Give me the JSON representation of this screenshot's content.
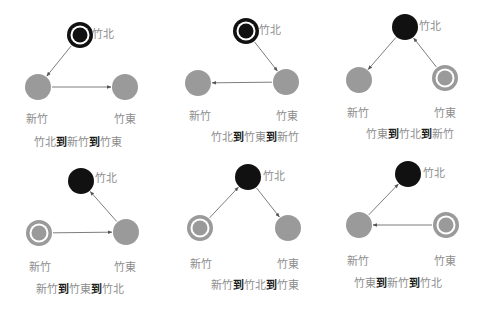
{
  "colors": {
    "node_fill": "#9a9a9a",
    "current_fill": "#111111",
    "edge": "#6e6e6e",
    "label": "#8c8c8c",
    "connector": "#1a1a1a"
  },
  "legend": {
    "current_node": "black filled circle",
    "start_node": "double ring circle",
    "other_node": "grey filled circle"
  },
  "connector": "到",
  "panels": [
    {
      "id": "p1",
      "caption": [
        "竹北",
        "新竹",
        "竹東"
      ],
      "start": "竹北",
      "current": "竹北",
      "nodes": {
        "竹北": "start-current",
        "新竹": "normal",
        "竹東": "normal"
      },
      "edges": [
        [
          "竹北",
          "新竹"
        ],
        [
          "新竹",
          "竹東"
        ]
      ]
    },
    {
      "id": "p2",
      "caption": [
        "竹北",
        "竹東",
        "新竹"
      ],
      "start": "竹北",
      "current": "竹北",
      "nodes": {
        "竹北": "start-current",
        "新竹": "normal",
        "竹東": "normal"
      },
      "edges": [
        [
          "竹北",
          "竹東"
        ],
        [
          "竹東",
          "新竹"
        ]
      ]
    },
    {
      "id": "p3",
      "caption": [
        "竹東",
        "竹北",
        "新竹"
      ],
      "start": "竹東",
      "current": "竹北",
      "nodes": {
        "竹北": "current",
        "新竹": "normal",
        "竹東": "start"
      },
      "edges": [
        [
          "竹東",
          "竹北"
        ],
        [
          "竹北",
          "新竹"
        ]
      ]
    },
    {
      "id": "p4",
      "caption": [
        "新竹",
        "竹東",
        "竹北"
      ],
      "start": "新竹",
      "current": "竹北",
      "nodes": {
        "竹北": "current",
        "新竹": "start",
        "竹東": "normal"
      },
      "edges": [
        [
          "新竹",
          "竹東"
        ],
        [
          "竹東",
          "竹北"
        ]
      ]
    },
    {
      "id": "p5",
      "caption": [
        "新竹",
        "竹北",
        "竹東"
      ],
      "start": "新竹",
      "current": "竹北",
      "nodes": {
        "竹北": "current",
        "新竹": "start",
        "竹東": "normal"
      },
      "edges": [
        [
          "新竹",
          "竹北"
        ],
        [
          "竹北",
          "竹東"
        ]
      ]
    },
    {
      "id": "p6",
      "caption": [
        "竹東",
        "新竹",
        "竹北"
      ],
      "start": "竹東",
      "current": "竹北",
      "nodes": {
        "竹北": "current",
        "新竹": "normal",
        "竹東": "start"
      },
      "edges": [
        [
          "竹東",
          "新竹"
        ],
        [
          "新竹",
          "竹北"
        ]
      ]
    }
  ]
}
